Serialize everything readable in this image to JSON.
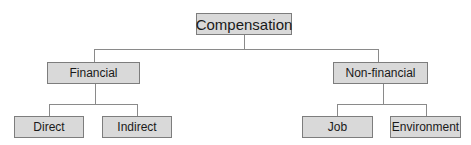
{
  "diagram": {
    "type": "org-chart",
    "root": {
      "label": "Compensation"
    },
    "level1": [
      {
        "label": "Financial"
      },
      {
        "label": "Non-financial"
      }
    ],
    "level2": {
      "financial": [
        {
          "label": "Direct"
        },
        {
          "label": "Indirect"
        }
      ],
      "non_financial": [
        {
          "label": "Job"
        },
        {
          "label": "Environment"
        }
      ]
    },
    "colors": {
      "box_fill": "#d9d9d9",
      "box_border": "#7d7d7d",
      "connector": "#8a8a8a",
      "text": "#1a1a1a"
    }
  }
}
